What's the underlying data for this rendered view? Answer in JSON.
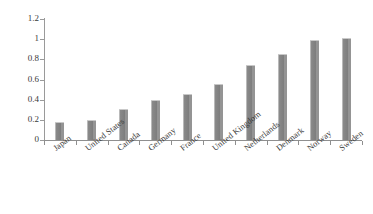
{
  "chart_data": {
    "type": "bar",
    "title": "",
    "subtitle": "",
    "xlabel": "",
    "ylabel": "",
    "categories": [
      "Japan",
      "United States",
      "Canada",
      "Germany",
      "France",
      "United Kingdom",
      "Netherlands",
      "Denmark",
      "Norway",
      "Sweden"
    ],
    "values": [
      0.18,
      0.2,
      0.31,
      0.4,
      0.46,
      0.56,
      0.74,
      0.85,
      0.99,
      1.01
    ],
    "ylim": [
      0,
      1.2
    ],
    "ytick_values": [
      0,
      0.2,
      0.4,
      0.6,
      0.8,
      1,
      1.2
    ],
    "ytick_labels": [
      "0",
      "0.2",
      "0.4",
      "0.6",
      "0.8",
      "1",
      "1.2"
    ],
    "grid": false,
    "legend": null,
    "legend_position": "none",
    "annotations": [],
    "bar_color": "#808080",
    "axis_color": "#8f8f8f",
    "text_color": "#3a3a3a",
    "background_color": "#ffffff"
  }
}
